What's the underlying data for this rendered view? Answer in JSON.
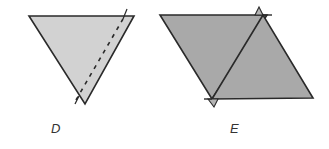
{
  "figures": [
    {
      "id": "D",
      "label": "D",
      "shape": "inverted-triangle-with-dashed-fold-line",
      "fill_color": "#d2d2d2",
      "stroke_color": "#2a2a2a"
    },
    {
      "id": "E",
      "label": "E",
      "shape": "parallelogram-of-two-triangles",
      "fill_color": "#a9a9a9",
      "stroke_color": "#2a2a2a"
    }
  ]
}
